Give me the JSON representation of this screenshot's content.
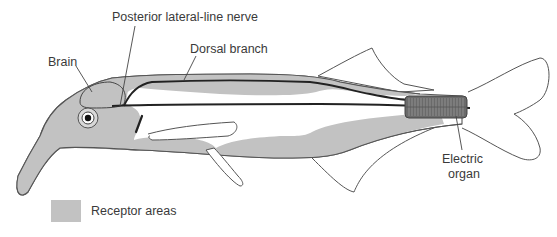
{
  "diagram": {
    "labels": {
      "posterior_nerve": "Posterior lateral-line nerve",
      "dorsal_branch": "Dorsal branch",
      "brain": "Brain",
      "electric_organ_line1": "Electric",
      "electric_organ_line2": "organ"
    },
    "legend": {
      "receptor_areas": "Receptor areas"
    },
    "colors": {
      "receptor_fill": "#c2c2c2",
      "outline": "#555555",
      "nerve": "#222222",
      "electric_organ": "#6a6a6a",
      "text": "#3a3a3a",
      "background": "#ffffff"
    }
  }
}
